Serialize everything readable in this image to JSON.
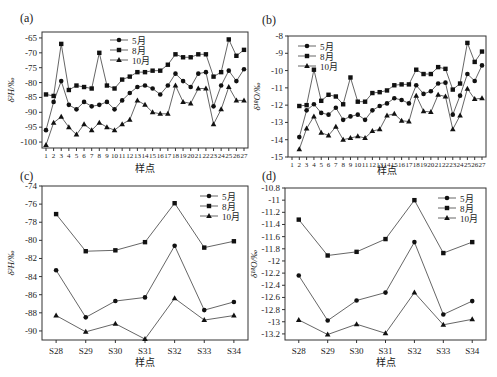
{
  "figure": {
    "panels": [
      {
        "id": "a",
        "label": "(a)",
        "ylabel": "δ²H/‰",
        "xlabel": "样点"
      },
      {
        "id": "b",
        "label": "(b)",
        "ylabel": "δ¹⁸O/‰",
        "xlabel": "样点"
      },
      {
        "id": "c",
        "label": "(c)",
        "ylabel": "δ²H/‰",
        "xlabel": "样点"
      },
      {
        "id": "d",
        "label": "(d)",
        "ylabel": "δ¹⁸O/‰",
        "xlabel": "样点"
      }
    ],
    "legend": [
      {
        "name": "5月",
        "marker": "circle"
      },
      {
        "name": "8月",
        "marker": "square"
      },
      {
        "name": "10月",
        "marker": "triangle"
      }
    ],
    "line_color": "#555555",
    "marker_color": "#111111"
  },
  "chart_data": [
    {
      "panel": "a",
      "type": "line",
      "title": "(a)",
      "xlabel": "样点",
      "ylabel": "δ²H/‰",
      "x": [
        1,
        2,
        3,
        4,
        5,
        6,
        7,
        8,
        9,
        10,
        11,
        12,
        13,
        14,
        15,
        16,
        17,
        18,
        19,
        20,
        21,
        22,
        23,
        24,
        25,
        26,
        27
      ],
      "xticks": [
        "1",
        "2",
        "3",
        "4",
        "5",
        "6",
        "7",
        "8",
        "9",
        "10",
        "11",
        "12",
        "13",
        "14",
        "15",
        "16",
        "17",
        "18",
        "19",
        "20",
        "21",
        "22",
        "23",
        "24",
        "25",
        "26",
        "27"
      ],
      "ylim": [
        -102,
        -63
      ],
      "yticks": [
        -65,
        -70,
        -75,
        -80,
        -85,
        -90,
        -95,
        -100
      ],
      "grid": false,
      "legend_position": "upper-left-center",
      "series": [
        {
          "name": "5月",
          "marker": "circle",
          "values": [
            -96,
            -86.5,
            -79.5,
            -87.5,
            -89,
            -86.5,
            -88,
            -87.5,
            -86.5,
            -89,
            -86,
            -83.5,
            -81.5,
            -81,
            -82,
            -84,
            -81,
            -77,
            -79.5,
            -81.5,
            -77,
            -76.5,
            -88,
            -81,
            -76,
            -79.5,
            -75.5
          ]
        },
        {
          "name": "8月",
          "marker": "square",
          "values": [
            -84,
            -84.5,
            -67,
            -82.5,
            -81,
            -81.5,
            -82,
            -70,
            -81,
            -82,
            -79,
            -78,
            -76.5,
            -76.5,
            -76,
            -76,
            -74,
            -70.5,
            -71.5,
            -71.5,
            -70.5,
            -70.5,
            -78,
            -76.5,
            -65.5,
            -71,
            -69
          ]
        },
        {
          "name": "10月",
          "marker": "triangle",
          "values": [
            -101,
            -93.5,
            -91.5,
            -95,
            -97.5,
            -94,
            -96,
            -93.5,
            -95,
            -96,
            -94,
            -92.5,
            -86,
            -87.5,
            -90,
            -90.5,
            -90.5,
            -81,
            -86.5,
            -87,
            -82,
            -82,
            -94,
            -89,
            -81.5,
            -86,
            -86
          ]
        }
      ]
    },
    {
      "panel": "b",
      "type": "line",
      "title": "(b)",
      "xlabel": "样点",
      "ylabel": "δ¹⁸O/‰",
      "x": [
        2,
        3,
        4,
        5,
        6,
        7,
        8,
        9,
        10,
        11,
        12,
        13,
        14,
        15,
        16,
        17,
        18,
        19,
        20,
        21,
        22,
        23,
        24,
        25,
        26,
        27
      ],
      "xticks": [
        "1",
        "2",
        "3",
        "4",
        "5",
        "6",
        "7",
        "8",
        "9",
        "10",
        "11",
        "12",
        "13",
        "14",
        "15",
        "16",
        "17",
        "18",
        "19",
        "20",
        "21",
        "22",
        "23",
        "24",
        "25",
        "26",
        "27"
      ],
      "xlim": [
        1,
        27
      ],
      "ylim": [
        -15,
        -8
      ],
      "yticks": [
        -8,
        -9,
        -10,
        -11,
        -12,
        -13,
        -14,
        -15
      ],
      "grid": false,
      "legend_position": "upper-left",
      "series": [
        {
          "name": "5月",
          "marker": "circle",
          "values": [
            -13.85,
            -12.3,
            -11.95,
            -12.45,
            -12.55,
            -12.15,
            -12.85,
            -12.65,
            -12.55,
            -12.85,
            -12.3,
            -12.05,
            -11.9,
            -11.6,
            -11.7,
            -11.9,
            -10.85,
            -11.35,
            -11.2,
            -10.75,
            -10.7,
            -12.55,
            -11.45,
            -10.2,
            -10.6,
            -9.7
          ]
        },
        {
          "name": "8月",
          "marker": "square",
          "values": [
            -12.05,
            -12.0,
            -9.95,
            -11.75,
            -11.4,
            -11.5,
            -11.95,
            -10.4,
            -11.8,
            -11.8,
            -11.3,
            -11.25,
            -11.15,
            -10.85,
            -10.8,
            -10.8,
            -9.95,
            -10.2,
            -10.2,
            -9.8,
            -9.9,
            -11.1,
            -10.75,
            -8.4,
            -9.5,
            -8.9
          ]
        },
        {
          "name": "10月",
          "marker": "triangle",
          "values": [
            -14.55,
            -13.35,
            -12.65,
            -13.6,
            -13.75,
            -13.25,
            -14.0,
            -13.9,
            -13.8,
            -13.9,
            -13.5,
            -13.4,
            -12.6,
            -12.5,
            -12.9,
            -12.95,
            -11.45,
            -12.35,
            -12.4,
            -11.4,
            -11.5,
            -13.4,
            -12.6,
            -11.05,
            -11.65,
            -11.6
          ]
        }
      ]
    },
    {
      "panel": "c",
      "type": "line",
      "title": "(c)",
      "xlabel": "样点",
      "ylabel": "δ²H/‰",
      "categories": [
        "S28",
        "S29",
        "S30",
        "S31",
        "S32",
        "S33",
        "S34"
      ],
      "ylim": [
        -91,
        -74
      ],
      "yticks": [
        -74,
        -76,
        -78,
        -80,
        -82,
        -84,
        -86,
        -88,
        -90
      ],
      "grid": false,
      "legend_position": "upper-right",
      "series": [
        {
          "name": "5月",
          "marker": "circle",
          "values": [
            -83.3,
            -88.5,
            -86.7,
            -86.3,
            -80.6,
            -87.7,
            -86.8
          ]
        },
        {
          "name": "8月",
          "marker": "square",
          "values": [
            -77.1,
            -81.2,
            -81.1,
            -80.2,
            -75.9,
            -80.8,
            -80.1
          ]
        },
        {
          "name": "10月",
          "marker": "triangle",
          "values": [
            -88.3,
            -90.1,
            -89.2,
            -90.9,
            -86.4,
            -88.8,
            -88.3
          ]
        }
      ]
    },
    {
      "panel": "d",
      "type": "line",
      "title": "(d)",
      "xlabel": "样点",
      "ylabel": "δ¹⁸O/‰",
      "categories": [
        "S28",
        "S29",
        "S30",
        "S31",
        "S32",
        "S33",
        "S34"
      ],
      "ylim": [
        -13.3,
        -10.8
      ],
      "yticks": [
        -10.8,
        -11,
        -11.2,
        -11.4,
        -11.6,
        -11.8,
        -12,
        -12.2,
        -12.4,
        -12.6,
        -12.8,
        -13,
        -13.2
      ],
      "grid": false,
      "legend_position": "upper-right",
      "series": [
        {
          "name": "5月",
          "marker": "circle",
          "values": [
            -12.24,
            -12.98,
            -12.65,
            -12.52,
            -11.69,
            -12.88,
            -12.66
          ]
        },
        {
          "name": "8月",
          "marker": "square",
          "values": [
            -11.32,
            -11.91,
            -11.85,
            -11.64,
            -11.0,
            -11.87,
            -11.69
          ]
        },
        {
          "name": "10月",
          "marker": "triangle",
          "values": [
            -12.97,
            -13.21,
            -13.04,
            -13.19,
            -12.52,
            -13.05,
            -12.96
          ]
        }
      ]
    }
  ]
}
